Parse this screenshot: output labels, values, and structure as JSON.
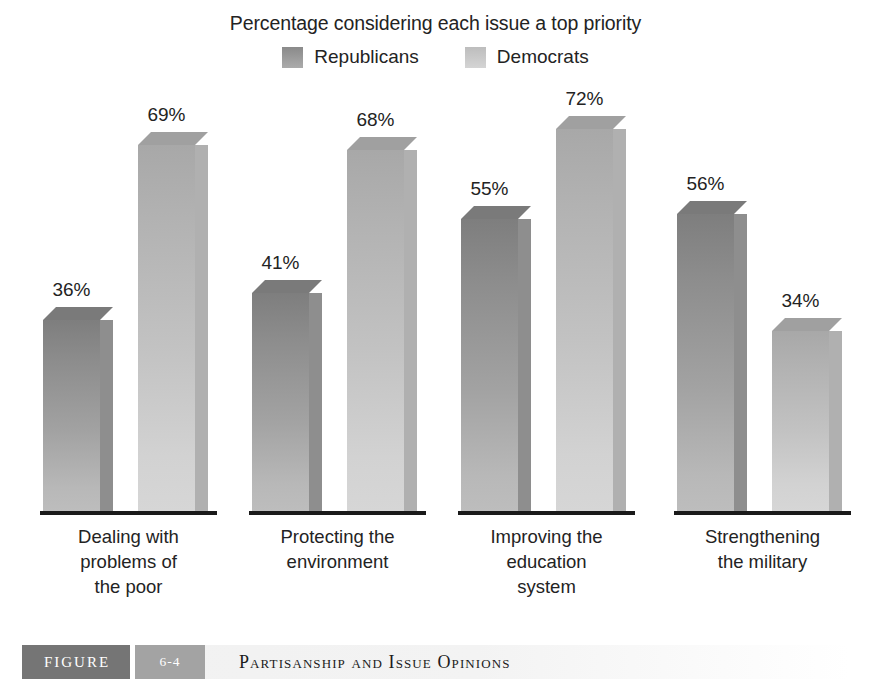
{
  "chart_data": {
    "type": "bar",
    "title": "Percentage considering each issue a top priority",
    "xlabel": "",
    "ylabel": "",
    "ylim": [
      0,
      80
    ],
    "grid": false,
    "legend_position": "top-center",
    "categories": [
      "Dealing with problems of the poor",
      "Protecting the environment",
      "Improving the education system",
      "Strengthening the military"
    ],
    "category_lines": [
      [
        "Dealing with",
        "problems of",
        "the poor"
      ],
      [
        "Protecting the",
        "environment"
      ],
      [
        "Improving the",
        "education",
        "system"
      ],
      [
        "Strengthening",
        "the military"
      ]
    ],
    "series": [
      {
        "name": "Republicans",
        "color": "#8e8e8e",
        "values": [
          36,
          41,
          55,
          56
        ],
        "labels": [
          "36%",
          "41%",
          "55%",
          "56%"
        ]
      },
      {
        "name": "Democrats",
        "color": "#c3c3c3",
        "values": [
          69,
          68,
          72,
          34
        ],
        "labels": [
          "69%",
          "68%",
          "72%",
          "34%"
        ]
      }
    ]
  },
  "legend": {
    "items": [
      {
        "label": "Republicans",
        "swatch": "republicans-swatch"
      },
      {
        "label": "Democrats",
        "swatch": "democrats-swatch"
      }
    ]
  },
  "caption": {
    "figure_word": "FIGURE",
    "figure_number": "6-4",
    "figure_title": "Partisanship and Issue Opinions"
  },
  "colors": {
    "republican": "#8e8e8e",
    "democrat": "#c3c3c3",
    "baseline": "#1a1a1a",
    "caption_box_dark": "#757575",
    "caption_box_light": "#a3a3a3",
    "caption_strip": "#f2f2f2",
    "text": "#232323"
  }
}
